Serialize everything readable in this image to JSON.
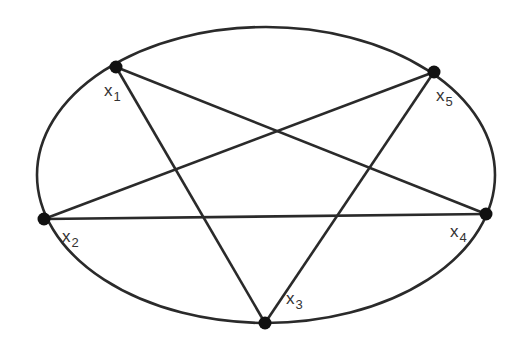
{
  "diagram": {
    "type": "graph",
    "colors": {
      "background": "#ffffff",
      "stroke": "#2a2a2a",
      "node": "#111111",
      "label": "#333333"
    },
    "ellipse": {
      "cx": 266,
      "cy": 175,
      "rx": 229,
      "ry": 148
    },
    "nodes": [
      {
        "id": "x1",
        "base": "x",
        "sub": "1",
        "x": 116,
        "y": 67,
        "label_x": 104,
        "label_y": 96
      },
      {
        "id": "x2",
        "base": "x",
        "sub": "2",
        "x": 44,
        "y": 219,
        "label_x": 62,
        "label_y": 242
      },
      {
        "id": "x3",
        "base": "x",
        "sub": "3",
        "x": 265,
        "y": 323,
        "label_x": 286,
        "label_y": 304
      },
      {
        "id": "x4",
        "base": "x",
        "sub": "4",
        "x": 486,
        "y": 214,
        "label_x": 450,
        "label_y": 237
      },
      {
        "id": "x5",
        "base": "x",
        "sub": "5",
        "x": 434,
        "y": 72,
        "label_x": 436,
        "label_y": 101
      }
    ],
    "edges": [
      {
        "from": "x1",
        "to": "x3"
      },
      {
        "from": "x1",
        "to": "x4"
      },
      {
        "from": "x2",
        "to": "x5"
      },
      {
        "from": "x2",
        "to": "x4"
      },
      {
        "from": "x3",
        "to": "x5"
      }
    ]
  }
}
